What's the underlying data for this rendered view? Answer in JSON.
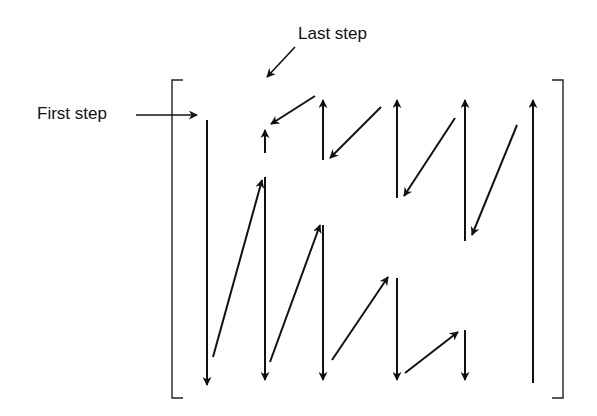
{
  "labels": {
    "first_step": "First step",
    "last_step": "Last step"
  },
  "colors": {
    "stroke": "#111111",
    "background": "#ffffff"
  },
  "diagram": {
    "type": "zigzag scan path over a matrix (bracketed)",
    "brackets": {
      "left_x": 172,
      "right_x": 563,
      "top_y": 80,
      "bottom_y": 398
    },
    "columns_x": [
      207,
      265,
      323,
      397,
      465,
      533
    ],
    "vertical_arrows": [
      {
        "x": 207,
        "from": 120,
        "to": 385,
        "dir": "down"
      },
      {
        "x": 265,
        "from": 177,
        "to": 380,
        "dir": "down"
      },
      {
        "x": 265,
        "from": 153,
        "to": 130,
        "dir": "up"
      },
      {
        "x": 323,
        "from": 160,
        "to": 100,
        "dir": "up"
      },
      {
        "x": 323,
        "from": 225,
        "to": 380,
        "dir": "down"
      },
      {
        "x": 397,
        "from": 198,
        "to": 100,
        "dir": "up"
      },
      {
        "x": 397,
        "from": 278,
        "to": 380,
        "dir": "down"
      },
      {
        "x": 465,
        "from": 241,
        "to": 100,
        "dir": "up"
      },
      {
        "x": 465,
        "from": 330,
        "to": 380,
        "dir": "down"
      },
      {
        "x": 533,
        "from": 383,
        "to": 100,
        "dir": "up"
      }
    ],
    "diagonal_arrows": [
      {
        "x1": 213,
        "y1": 357,
        "x2": 262,
        "y2": 180
      },
      {
        "x1": 270,
        "y1": 362,
        "x2": 320,
        "y2": 225
      },
      {
        "x1": 332,
        "y1": 360,
        "x2": 388,
        "y2": 277
      },
      {
        "x1": 405,
        "y1": 373,
        "x2": 458,
        "y2": 332
      },
      {
        "x1": 315,
        "y1": 96,
        "x2": 271,
        "y2": 124
      },
      {
        "x1": 381,
        "y1": 107,
        "x2": 330,
        "y2": 158
      },
      {
        "x1": 455,
        "y1": 118,
        "x2": 404,
        "y2": 196
      },
      {
        "x1": 517,
        "y1": 125,
        "x2": 472,
        "y2": 235
      }
    ],
    "pointer_arrows": [
      {
        "label": "first_step",
        "x1": 136,
        "y1": 115,
        "x2": 197,
        "y2": 115
      },
      {
        "label": "last_step",
        "x1": 295,
        "y1": 47,
        "x2": 267,
        "y2": 77
      }
    ]
  }
}
